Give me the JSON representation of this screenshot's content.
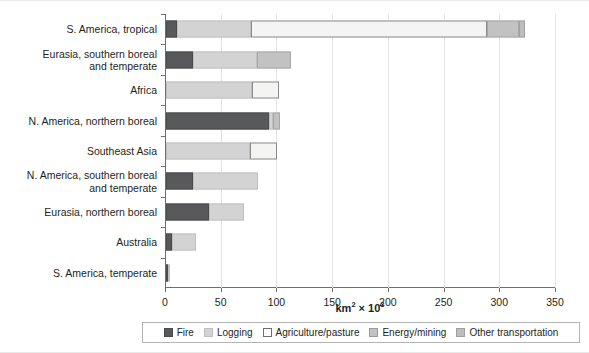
{
  "chart_data": {
    "type": "bar",
    "orientation": "horizontal",
    "stacked": true,
    "title": "",
    "xlabel": "km² × 10³",
    "xlabel_base": "km",
    "xlabel_sup1": "2",
    "xlabel_mid": " × 10",
    "xlabel_sup2": "3",
    "ylabel": "",
    "xlim": [
      0,
      350
    ],
    "xticks": [
      0,
      50,
      100,
      150,
      200,
      250,
      300,
      350
    ],
    "xticklabels": [
      "0",
      "50",
      "100",
      "150",
      "200",
      "250",
      "300",
      "350"
    ],
    "grid": "vertical",
    "legend_position": "bottom",
    "categories": [
      "S. America, tropical",
      "Eurasia, southern boreal and temperate",
      "Africa",
      "N. America, northern boreal",
      "Southeast Asia",
      "N. America, southern boreal and temperate",
      "Eurasia, northern boreal",
      "Australia",
      "S. America, temperate"
    ],
    "category_lines": [
      [
        "S. America, tropical"
      ],
      [
        "Eurasia, southern boreal",
        "and temperate"
      ],
      [
        "Africa"
      ],
      [
        "N. America, northern boreal"
      ],
      [
        "Southeast Asia"
      ],
      [
        "N. America, southern boreal",
        "and temperate"
      ],
      [
        "Eurasia, northern boreal"
      ],
      [
        "Australia"
      ],
      [
        "S. America, temperate"
      ]
    ],
    "series": [
      {
        "name": "Fire",
        "color": "#58595b",
        "values": [
          10,
          24,
          0,
          92,
          0,
          24,
          39,
          5,
          1
        ]
      },
      {
        "name": "Logging",
        "color": "#d3d3d3",
        "values": [
          66,
          58,
          77,
          4,
          75,
          59,
          31,
          22,
          1
        ]
      },
      {
        "name": "Agriculture/pasture",
        "color": "#ffffff",
        "values": [
          212,
          0,
          24,
          0,
          25,
          0,
          0,
          0,
          0
        ]
      },
      {
        "name": "Energy/mining",
        "color": "#c2c2c2",
        "values": [
          29,
          30,
          0,
          6,
          0,
          0,
          0,
          0,
          0
        ]
      },
      {
        "name": "Other transportation",
        "color": "#bdbdbd",
        "values": [
          5,
          0,
          0,
          0,
          0,
          0,
          0,
          0,
          0
        ]
      }
    ],
    "totals": [
      322,
      112,
      101,
      102,
      100,
      83,
      70,
      27,
      2
    ]
  },
  "legend": {
    "items": [
      {
        "label": "Fire",
        "swatch": "swatch-fire"
      },
      {
        "label": "Logging",
        "swatch": "swatch-logging"
      },
      {
        "label": "Agriculture/pasture",
        "swatch": "swatch-agriculture"
      },
      {
        "label": "Energy/mining",
        "swatch": "swatch-energy"
      },
      {
        "label": "Other transportation",
        "swatch": "swatch-transport"
      }
    ]
  }
}
